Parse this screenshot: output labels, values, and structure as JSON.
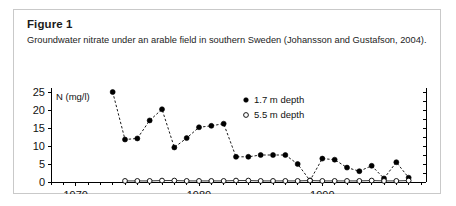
{
  "figure": {
    "title": "Figure 1",
    "caption": "Groundwater nitrate under an arable field in southern Sweden (Johansson and Gustafson, 2004)."
  },
  "chart_data": {
    "type": "line",
    "title": "",
    "xlabel": "",
    "ylabel": "N (mg/l)",
    "y_axis_caption": "N (mg/l)",
    "xlim": [
      1968,
      1998
    ],
    "ylim": [
      0,
      25
    ],
    "yticks": [
      0,
      5,
      10,
      15,
      20,
      25
    ],
    "ytick_labels": [
      "0",
      "5",
      "10",
      "15",
      "20",
      "25"
    ],
    "xticks": [
      1970,
      1980,
      1990
    ],
    "xtick_labels": [
      "1970",
      "1980",
      "1990"
    ],
    "x_minor_tick_step": 1,
    "grid": false,
    "legend_position": "upper-right-inside",
    "series": [
      {
        "name": "1.7 m depth",
        "marker": "filled-circle",
        "line_style": "dashed",
        "x": [
          1973,
          1974,
          1975,
          1976,
          1977,
          1978,
          1979,
          1980,
          1981,
          1982,
          1983,
          1984,
          1985,
          1986,
          1987,
          1988,
          1989,
          1990,
          1991,
          1992,
          1993,
          1994,
          1995,
          1996,
          1997
        ],
        "values": [
          25.0,
          11.8,
          12.1,
          17.1,
          20.2,
          9.6,
          12.2,
          15.2,
          15.6,
          16.2,
          7.0,
          7.0,
          7.5,
          7.5,
          7.5,
          5.0,
          0.4,
          6.5,
          6.2,
          4.0,
          3.0,
          4.5,
          1.0,
          5.5,
          1.2
        ]
      },
      {
        "name": "5.5 m depth",
        "marker": "open-circle",
        "line_style": "solid",
        "x": [
          1974,
          1975,
          1976,
          1977,
          1978,
          1979,
          1980,
          1981,
          1982,
          1983,
          1984,
          1985,
          1986,
          1987,
          1988,
          1989,
          1990,
          1991,
          1992,
          1993,
          1994,
          1995,
          1996,
          1997
        ],
        "values": [
          0.3,
          0.3,
          0.3,
          0.4,
          0.4,
          0.3,
          0.3,
          0.3,
          0.3,
          0.4,
          0.4,
          0.3,
          0.3,
          0.3,
          0.3,
          0.4,
          0.3,
          0.3,
          0.3,
          0.3,
          0.4,
          0.3,
          0.3,
          0.4
        ]
      }
    ],
    "legend": [
      {
        "label": "1.7 m depth",
        "marker": "filled-circle"
      },
      {
        "label": "5.5 m depth",
        "marker": "open-circle"
      }
    ]
  }
}
